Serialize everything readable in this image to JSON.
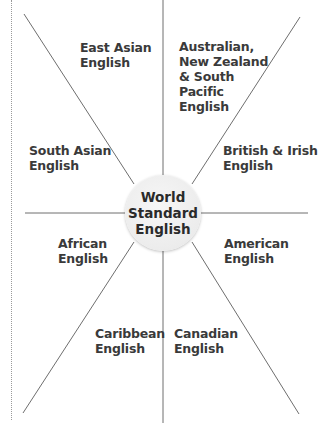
{
  "diagram": {
    "type": "radial-hub",
    "center": {
      "label": "World\nStandard\nEnglish"
    },
    "spokes": [
      {
        "label": "East Asian\nEnglish"
      },
      {
        "label": "Australian,\nNew Zealand\n& South\nPacific\nEnglish"
      },
      {
        "label": "British & Irish\nEnglish"
      },
      {
        "label": "American\nEnglish"
      },
      {
        "label": "Canadian\nEnglish"
      },
      {
        "label": "Caribbean\nEnglish"
      },
      {
        "label": "African\nEnglish"
      },
      {
        "label": "South Asian\nEnglish"
      }
    ],
    "colors": {
      "line": "#6e6e6e",
      "text": "#3a3a3a",
      "circle_fill": "#ececec"
    }
  }
}
